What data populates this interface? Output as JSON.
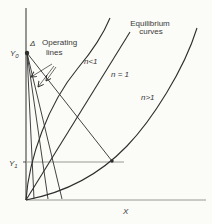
{
  "figure": {
    "background": "#fbfbf7",
    "ink_color": "#2e2e2e",
    "muted_line_color": "#9a9a92",
    "text_color": "#3a3a3a"
  },
  "labels": {
    "equilibrium_title_line1": "Equilibrium",
    "equilibrium_title_line2": "curves",
    "operating_title_line1": "Operating",
    "operating_title_line2": "lines",
    "curve_n_lt_1": "n<1",
    "curve_n_eq_1": "n = 1",
    "curve_n_gt_1": "n>1",
    "y_top_letter": "Y",
    "y_top_sub": "0",
    "y_mid_letter": "Y",
    "y_mid_sub": "1",
    "x_axis_label": "X",
    "difference_point": "Δ"
  },
  "chart_data": {
    "type": "line",
    "xlabel": "X",
    "ylabel": "Y",
    "legend": [
      "Operating lines",
      "Equilibrium curves (n<1, n = 1, n>1)"
    ],
    "axes": {
      "y_axis_x_px": 26,
      "y_axis_top_px": 8,
      "x_axis_y_px": 200,
      "x_axis_end_px": 206,
      "y0_mark_y_px": 53,
      "y1_mark_y_px": 162,
      "y1_line_end_x_px": 124,
      "y1_tick_len_px": 3
    },
    "equilibrium_curves": [
      {
        "name": "equilibrium-curve-n-lt-1",
        "n": "n<1",
        "path": "M 26 200 C 29 158 48 104 78 68 C 94 49 103 35 110 18"
      },
      {
        "name": "equilibrium-curve-n-eq-1",
        "n": "n = 1",
        "path": "M 26 200 L 130 32"
      },
      {
        "name": "equilibrium-curve-n-gt-1",
        "n": "n>1",
        "path": "M 26 200 C 68 192 102 172 127 146 C 152 120 184 70 197 28"
      }
    ],
    "operating_lines": [
      {
        "name": "operating-line-1",
        "from": [
          27,
          53
        ],
        "to": [
          34,
          199
        ]
      },
      {
        "name": "operating-line-2",
        "from": [
          27,
          53
        ],
        "to": [
          48,
          199
        ]
      },
      {
        "name": "operating-line-3",
        "from": [
          27,
          53
        ],
        "to": [
          62,
          199
        ]
      },
      {
        "name": "operating-line-4",
        "from": [
          27,
          53
        ],
        "to": [
          112,
          161
        ]
      }
    ],
    "points": [
      {
        "name": "difference-point-marker",
        "x": 27,
        "y": 53,
        "r": 2.2
      },
      {
        "name": "y1-intersection-marker",
        "x": 112,
        "y": 161,
        "r": 1.7
      }
    ],
    "annotation_arrows": [
      {
        "name": "operating-lines-arrow-1",
        "from": [
          52,
          64
        ],
        "to": [
          31,
          77
        ]
      },
      {
        "name": "operating-lines-arrow-2",
        "from": [
          54,
          66
        ],
        "to": [
          38,
          87
        ]
      },
      {
        "name": "operating-lines-arrow-3",
        "from": [
          56,
          67
        ],
        "to": [
          46,
          81
        ]
      }
    ]
  }
}
